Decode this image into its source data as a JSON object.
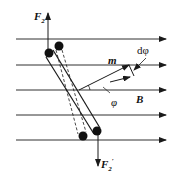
{
  "diagram": {
    "labels": {
      "F2": "F",
      "F2_sub": "2",
      "F2prime": "F",
      "F2prime_sub": "2",
      "F2prime_sup": "′",
      "m": "m",
      "B": "B",
      "phi": "φ",
      "dphi": "dφ"
    },
    "field_lines_y": [
      39,
      65,
      90,
      115,
      140
    ],
    "colors": {
      "stroke": "#1a1a1a",
      "background": "#ffffff"
    }
  }
}
